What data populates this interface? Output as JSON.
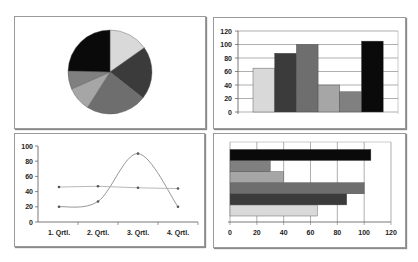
{
  "chart_data": [
    {
      "type": "pie",
      "title": "",
      "values": [
        65,
        87,
        100,
        40,
        30,
        105
      ],
      "colors": [
        "#d9d9d9",
        "#3b3b3b",
        "#6e6e6e",
        "#a6a6a6",
        "#808080",
        "#0a0a0a"
      ],
      "start_angle": "12 o'clock, clockwise",
      "legend": "none"
    },
    {
      "type": "bar",
      "orientation": "vertical",
      "title": "",
      "categories": [
        "1",
        "2",
        "3",
        "4",
        "5",
        "6"
      ],
      "values": [
        65,
        87,
        100,
        40,
        30,
        105
      ],
      "colors": [
        "#d9d9d9",
        "#3b3b3b",
        "#6e6e6e",
        "#a6a6a6",
        "#808080",
        "#0a0a0a"
      ],
      "ylim": [
        0,
        120
      ],
      "yticks": [
        "0",
        "20",
        "40",
        "60",
        "80",
        "100",
        "120"
      ],
      "grid": true,
      "legend": "none"
    },
    {
      "type": "line",
      "title": "",
      "categories": [
        "1. Qrtl.",
        "2. Qrtl.",
        "3. Qrtl.",
        "4. Qrtl."
      ],
      "series": [
        {
          "name": "Series 1",
          "values": [
            20,
            27,
            90,
            20
          ],
          "smooth": true,
          "color": "#8a8a8a"
        },
        {
          "name": "Series 2",
          "values": [
            46,
            47,
            45,
            44
          ],
          "smooth": false,
          "color": "#b0b0b0"
        }
      ],
      "ylim": [
        0,
        100
      ],
      "yticks": [
        "0",
        "20",
        "40",
        "60",
        "80",
        "100"
      ],
      "grid": false,
      "legend": "none"
    },
    {
      "type": "bar",
      "orientation": "horizontal",
      "title": "",
      "categories": [
        "1",
        "2",
        "3",
        "4",
        "5",
        "6"
      ],
      "values": [
        65,
        87,
        100,
        40,
        30,
        105
      ],
      "colors": [
        "#d9d9d9",
        "#3b3b3b",
        "#6e6e6e",
        "#a6a6a6",
        "#808080",
        "#0a0a0a"
      ],
      "xlim": [
        0,
        120
      ],
      "xticks": [
        "0",
        "20",
        "40",
        "60",
        "80",
        "100",
        "120"
      ],
      "grid": true,
      "legend": "none"
    }
  ]
}
